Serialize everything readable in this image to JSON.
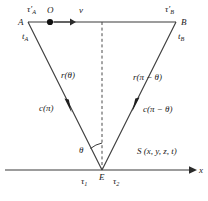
{
  "figure": {
    "type": "geometry-diagram",
    "stroke_color": "#3a3a3a",
    "text_color": "#1a1a1a",
    "labels": {
      "tau_a_prime": "τ′",
      "tau_a_prime_sub": "A",
      "point_a": "A",
      "t_a": "t",
      "t_a_sub": "A",
      "point_o": "O",
      "velocity": "v",
      "tau_b_prime": "τ′",
      "tau_b_prime_sub": "B",
      "point_b": "B",
      "t_b": "t",
      "t_b_sub": "B",
      "r_theta": "r(θ)",
      "c_pi": "c(π)",
      "r_pi_minus_theta": "r(π − θ)",
      "c_pi_minus_theta": "c(π − θ)",
      "theta": "θ",
      "point_e": "E",
      "tau_1": "τ",
      "tau_1_sub": "1",
      "tau_2": "τ",
      "tau_2_sub": "2",
      "source_frame": "S (x, y, z, t)",
      "x_axis": "x"
    },
    "geometry": {
      "point_a": [
        28,
        22
      ],
      "point_b": [
        176,
        22
      ],
      "point_o": [
        50,
        22
      ],
      "point_e": [
        102,
        170
      ],
      "dashed_line_top": [
        102,
        22
      ],
      "x_axis_start": [
        5,
        170
      ],
      "x_axis_end": [
        196,
        170
      ],
      "top_line_start": [
        28,
        22
      ],
      "top_line_end": [
        176,
        22
      ],
      "velocity_arrow_start": [
        54,
        22
      ],
      "velocity_arrow_end": [
        73,
        22
      ]
    }
  }
}
